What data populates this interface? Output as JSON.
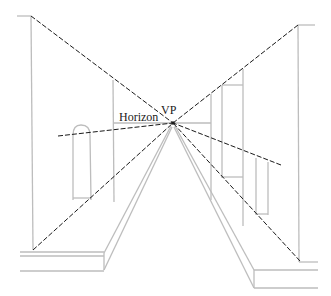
{
  "diagram": {
    "labels": {
      "vp": "VP",
      "horizon": "Horizon"
    },
    "vanishing_point": {
      "x": 173,
      "y": 123
    },
    "colors": {
      "background": "#ffffff",
      "construction_line": "#bdbdbd",
      "dashed_line": "#1a1a1a",
      "text": "#1a1a1a"
    }
  }
}
